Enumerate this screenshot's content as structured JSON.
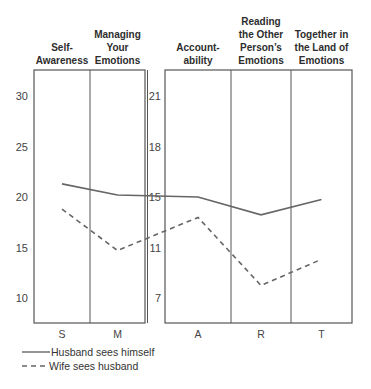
{
  "chart_data": {
    "type": "line",
    "title": "",
    "panels": [
      {
        "name": "left",
        "categories": [
          "S",
          "M"
        ],
        "headers": [
          [
            "Self-",
            "Awareness"
          ],
          [
            "Managing",
            "Your",
            "Emotions"
          ]
        ],
        "yticks": [
          30,
          25,
          20,
          15,
          10
        ],
        "ylim": [
          7.5,
          32.5
        ]
      },
      {
        "name": "right",
        "categories": [
          "A",
          "R",
          "T"
        ],
        "headers": [
          [
            "Account-",
            "ability"
          ],
          [
            "Reading",
            "the Other",
            "Person’s",
            "Emotions"
          ],
          [
            "Together in",
            "the Land of",
            "Emotions"
          ]
        ],
        "yticks": [
          21,
          18,
          15,
          11,
          7
        ],
        "ylim": [
          5.5,
          22.5
        ]
      }
    ],
    "categories": [
      "S",
      "M",
      "A",
      "R",
      "T"
    ],
    "series": [
      {
        "name": "Husband sees himself",
        "style": "solid",
        "values": [
          21.3,
          20.2,
          15.0,
          13.6,
          14.8
        ]
      },
      {
        "name": "Wife sees husband",
        "style": "dashed",
        "values": [
          18.8,
          14.7,
          13.4,
          8.0,
          10.1
        ]
      }
    ],
    "legend": {
      "position": "bottom-left",
      "entries": [
        "Husband sees himself",
        "Wife sees husband"
      ]
    },
    "xlabel": "",
    "ylabel": "",
    "grid": false,
    "colors": {
      "line": "#666666",
      "frame": "#555555"
    }
  }
}
